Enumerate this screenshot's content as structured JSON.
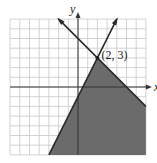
{
  "chart_data": {
    "type": "region",
    "title": "",
    "xlabel": "x",
    "ylabel": "y",
    "xlim": [
      -7,
      7
    ],
    "ylim": [
      -7,
      7
    ],
    "grid": true,
    "lines": [
      {
        "name": "line-positive-slope",
        "equation": "y = 2x - 1",
        "slope": 2,
        "intercept": -1,
        "from": [
          -3,
          -7
        ],
        "to": [
          4,
          7
        ]
      },
      {
        "name": "line-negative-slope",
        "equation": "y = -x + 5",
        "slope": -1,
        "intercept": 5,
        "from": [
          -2,
          7
        ],
        "to": [
          7,
          -2
        ]
      }
    ],
    "shaded_region": "below both lines (y <= 2x - 1 region side and y <= -x + 5)",
    "annotations": [
      {
        "text": "(2, 3)",
        "x": 2,
        "y": 3
      }
    ],
    "colors": {
      "shade": "#6b6b6b",
      "grid": "#c8c8c8",
      "line": "#2a2a2a"
    }
  },
  "labels": {
    "x_axis": "x",
    "y_axis": "y",
    "intersection": "(2, 3)"
  }
}
